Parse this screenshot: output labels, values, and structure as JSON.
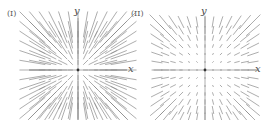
{
  "figures": [
    {
      "id": "I",
      "label": "(I)",
      "x_axis_label": "x",
      "y_axis_label": "y",
      "field": "radial, long arrows (length grows linearly with distance)",
      "origin": [
        78,
        70
      ],
      "spacing": 7.6,
      "half_count": 6,
      "scale": 0.55,
      "power": 1
    },
    {
      "id": "II",
      "label": "(II)",
      "x_axis_label": "x",
      "y_axis_label": "y",
      "field": "radial, short arrows (small near origin, growing toward corners)",
      "origin": [
        205,
        70
      ],
      "spacing": 8,
      "half_count": 6,
      "scale": 0.035,
      "power": 2
    }
  ],
  "style": {
    "stroke_color": "#8a8a8a",
    "axis_color": "#9a9a9a",
    "origin_color": "#333333"
  }
}
